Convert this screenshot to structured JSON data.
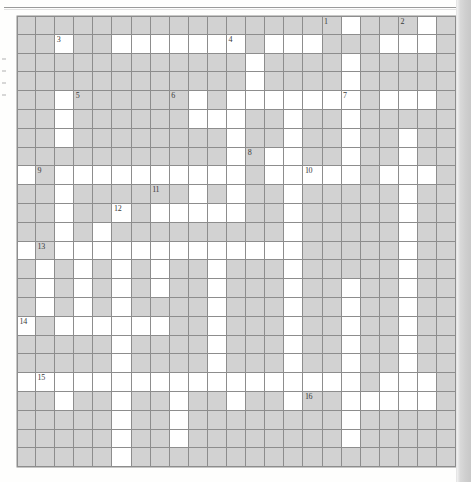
{
  "document": {
    "kind": "crossword-puzzle-grid",
    "page_type": "scanned-book-page",
    "top_rule": true
  },
  "colors": {
    "page_background": "#fefefd",
    "grid_line": "#8d8d8d",
    "blocked_cell": "#d2d2d2",
    "open_cell": "#ffffff",
    "clue_number_text": "#3a3a3a",
    "page_edge_shadow": "#cfcfcf"
  },
  "grid": {
    "columns": 23,
    "rows": 24,
    "cell_width_px": 19.1,
    "cell_height_px": 18.8,
    "origin_x_px": 17,
    "origin_y_px": 16,
    "legend": {
      "1": "blocked (gray) cell",
      "0": "open (white) cell"
    },
    "cells": [
      "11111111111111111011101",
      "11011000000010001110001",
      "11111111111101111011111",
      "11111111111101111011111",
      "11011111101000000010001",
      "11011111100011011011111",
      "11011111111011011011011",
      "11111111111010011011011",
      "01000000000010000010001",
      "11011111101011011111011",
      "11011010000011011111011",
      "11010111111111011111011",
      "01000000000000011111011",
      "10101010110111011111011",
      "10101010110111011011011",
      "10101011110111011011011",
      "01000000110111011011011",
      "11111011110111011011011",
      "11111011110111011011011",
      "00000000000000000010001",
      "11011011011011011000001",
      "11111011011111111011111",
      "11111011011111111011111",
      "11111011111111111111111"
    ],
    "clue_numbers": [
      {
        "label": "1",
        "row": 0,
        "col": 16
      },
      {
        "label": "2",
        "row": 0,
        "col": 20
      },
      {
        "label": "3",
        "row": 1,
        "col": 2
      },
      {
        "label": "4",
        "row": 1,
        "col": 11
      },
      {
        "label": "5",
        "row": 4,
        "col": 3
      },
      {
        "label": "6",
        "row": 4,
        "col": 8
      },
      {
        "label": "7",
        "row": 4,
        "col": 17
      },
      {
        "label": "8",
        "row": 7,
        "col": 12
      },
      {
        "label": "9",
        "row": 8,
        "col": 1
      },
      {
        "label": "10",
        "row": 8,
        "col": 15
      },
      {
        "label": "11",
        "row": 9,
        "col": 7
      },
      {
        "label": "12",
        "row": 10,
        "col": 5
      },
      {
        "label": "13",
        "row": 12,
        "col": 1
      },
      {
        "label": "14",
        "row": 16,
        "col": 0
      },
      {
        "label": "15",
        "row": 19,
        "col": 1
      },
      {
        "label": "16",
        "row": 20,
        "col": 15
      }
    ]
  },
  "margin_marks": [
    {
      "x": 2,
      "y": 58
    },
    {
      "x": 2,
      "y": 70
    },
    {
      "x": 2,
      "y": 82
    },
    {
      "x": 2,
      "y": 94
    }
  ]
}
